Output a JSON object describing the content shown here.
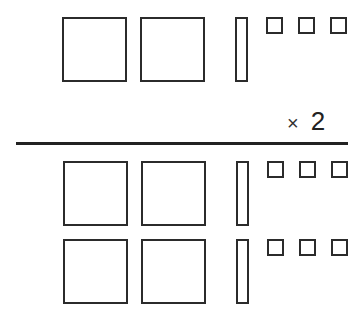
{
  "diagram": {
    "type": "base-ten-blocks-multiplication",
    "colors": {
      "stroke": "#2b2b2b",
      "fill": "#ffffff",
      "rule": "#222222"
    },
    "multiplicand_row": {
      "hundreds": 2,
      "tens": 1,
      "ones": 3,
      "value": 213
    },
    "operator": {
      "symbol": "×",
      "factor": "2"
    },
    "product_rows": [
      {
        "hundreds": 2,
        "tens": 1,
        "ones": 3
      },
      {
        "hundreds": 2,
        "tens": 1,
        "ones": 3
      }
    ]
  }
}
